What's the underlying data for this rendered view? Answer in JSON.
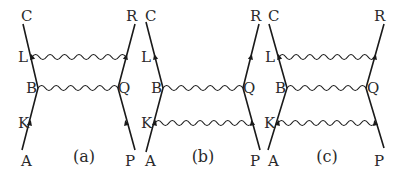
{
  "figure": {
    "colors": {
      "ink": "#1a1a1a",
      "background": "#ffffff"
    },
    "diagrams": [
      {
        "id": "a",
        "caption": "(a)",
        "caption_pos": [
          84,
          162
        ],
        "left_line": {
          "points": [
            [
              22,
              150
            ],
            [
              38,
              88
            ],
            [
              23,
              24
            ]
          ]
        },
        "right_line": {
          "points": [
            [
              135,
              150
            ],
            [
              118,
              88
            ],
            [
              135,
              24
            ]
          ]
        },
        "labels": [
          {
            "text": "C",
            "x": 21,
            "y": 21
          },
          {
            "text": "L",
            "x": 18,
            "y": 62
          },
          {
            "text": "B",
            "x": 26,
            "y": 93
          },
          {
            "text": "K",
            "x": 18,
            "y": 128
          },
          {
            "text": "A",
            "x": 21,
            "y": 166
          },
          {
            "text": "R",
            "x": 126,
            "y": 21
          },
          {
            "text": "Q",
            "x": 118,
            "y": 93
          },
          {
            "text": "P",
            "x": 125,
            "y": 166
          }
        ],
        "waves": [
          {
            "from": [
              32,
              57
            ],
            "to": [
              126,
              57
            ]
          },
          {
            "from": [
              38,
              88
            ],
            "to": [
              118,
              88
            ]
          }
        ],
        "arrows": [
          {
            "x": 32,
            "y": 57,
            "dir": "up-left"
          },
          {
            "x": 30,
            "y": 123,
            "dir": "up-right"
          },
          {
            "x": 126,
            "y": 57,
            "dir": "up-right"
          },
          {
            "x": 126,
            "y": 123,
            "dir": "up-left"
          }
        ]
      },
      {
        "id": "b",
        "caption": "(b)",
        "caption_pos": [
          203,
          162
        ],
        "left_line": {
          "points": [
            [
              146,
              152
            ],
            [
              163,
              88
            ],
            [
              146,
              22
            ]
          ]
        },
        "right_line": {
          "points": [
            [
              260,
              150
            ],
            [
              243,
              88
            ],
            [
              259,
              24
            ]
          ]
        },
        "labels": [
          {
            "text": "C",
            "x": 145,
            "y": 21
          },
          {
            "text": "L",
            "x": 141,
            "y": 62
          },
          {
            "text": "B",
            "x": 151,
            "y": 93
          },
          {
            "text": "K",
            "x": 141,
            "y": 128
          },
          {
            "text": "A",
            "x": 145,
            "y": 166
          },
          {
            "text": "R",
            "x": 250,
            "y": 21
          },
          {
            "text": "Q",
            "x": 243,
            "y": 93
          },
          {
            "text": "P",
            "x": 250,
            "y": 166
          }
        ],
        "waves": [
          {
            "from": [
              163,
              88
            ],
            "to": [
              243,
              88
            ]
          },
          {
            "from": [
              155,
              123
            ],
            "to": [
              252,
              123
            ]
          }
        ],
        "arrows": [
          {
            "x": 155,
            "y": 57,
            "dir": "up-left"
          },
          {
            "x": 155,
            "y": 123,
            "dir": "up-right"
          },
          {
            "x": 251,
            "y": 57,
            "dir": "up-right"
          },
          {
            "x": 252,
            "y": 123,
            "dir": "up-left"
          }
        ]
      },
      {
        "id": "c",
        "caption": "(c)",
        "caption_pos": [
          327,
          162
        ],
        "left_line": {
          "points": [
            [
              268,
              150
            ],
            [
              287,
              88
            ],
            [
              269,
              24
            ]
          ]
        },
        "right_line": {
          "points": [
            [
              384,
              148
            ],
            [
              366,
              88
            ],
            [
              384,
              24
            ]
          ]
        },
        "labels": [
          {
            "text": "C",
            "x": 268,
            "y": 21
          },
          {
            "text": "L",
            "x": 265,
            "y": 62
          },
          {
            "text": "B",
            "x": 275,
            "y": 93
          },
          {
            "text": "K",
            "x": 264,
            "y": 128
          },
          {
            "text": "A",
            "x": 268,
            "y": 166
          },
          {
            "text": "R",
            "x": 374,
            "y": 21
          },
          {
            "text": "Q",
            "x": 367,
            "y": 93
          },
          {
            "text": "P",
            "x": 374,
            "y": 166
          }
        ],
        "waves": [
          {
            "from": [
              279,
              57
            ],
            "to": [
              375,
              57
            ]
          },
          {
            "from": [
              287,
              88
            ],
            "to": [
              366,
              88
            ]
          },
          {
            "from": [
              278,
              123
            ],
            "to": [
              375,
              123
            ]
          }
        ],
        "arrows": [
          {
            "x": 279,
            "y": 57,
            "dir": "up-left"
          },
          {
            "x": 278,
            "y": 123,
            "dir": "up-right"
          },
          {
            "x": 375,
            "y": 57,
            "dir": "up-right"
          },
          {
            "x": 375,
            "y": 123,
            "dir": "up-left"
          }
        ]
      }
    ],
    "wave_style": {
      "period": 7,
      "amplitude": 2.5
    }
  }
}
